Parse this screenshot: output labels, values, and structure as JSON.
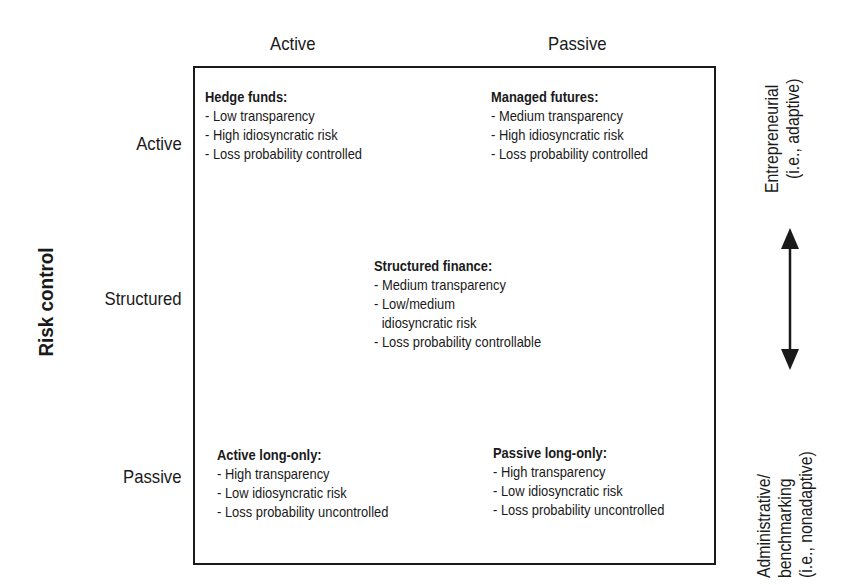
{
  "column_headers": [
    "Active",
    "Passive"
  ],
  "row_headers": [
    "Active",
    "Structured",
    "Passive"
  ],
  "y_axis_label": "Risk control",
  "right_axis": {
    "top_label": [
      "Entrepreneurial",
      "(i.e., adaptive)"
    ],
    "bottom_label": [
      "Administrative/",
      "benchmarking",
      "(i.e., nonadaptive)"
    ],
    "arrow": "double-headed-vertical-arrow"
  },
  "cells": {
    "hedge_funds": {
      "title": "Hedge funds:",
      "items": [
        "- Low transparency",
        "- High idiosyncratic risk",
        "- Loss probability controlled"
      ]
    },
    "managed_futures": {
      "title": "Managed futures:",
      "items": [
        "- Medium transparency",
        "- High idiosyncratic risk",
        "- Loss probability controlled"
      ]
    },
    "structured_finance": {
      "title": "Structured finance:",
      "items": [
        "- Medium transparency",
        "- Low/medium",
        "idiosyncratic risk",
        "- Loss probability controllable"
      ]
    },
    "active_long_only": {
      "title": "Active long-only:",
      "items": [
        "- High transparency",
        "- Low idiosyncratic risk",
        "- Loss probability uncontrolled"
      ]
    },
    "passive_long_only": {
      "title": "Passive long-only:",
      "items": [
        "- High transparency",
        "- Low idiosyncratic risk",
        "- Loss probability uncontrolled"
      ]
    }
  },
  "colors": {
    "ink": "#1a1a1a",
    "background": "#ffffff"
  }
}
